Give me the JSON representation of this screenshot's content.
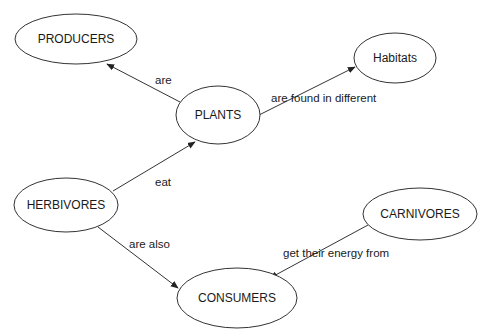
{
  "diagram": {
    "type": "concept-map",
    "nodes": [
      {
        "id": "producers",
        "label": "PRODUCERS",
        "cx": 76,
        "cy": 39,
        "rx": 61,
        "ry": 25
      },
      {
        "id": "plants",
        "label": "PLANTS",
        "cx": 218,
        "cy": 115,
        "rx": 42,
        "ry": 29
      },
      {
        "id": "habitats",
        "label": "Habitats",
        "cx": 395,
        "cy": 58,
        "rx": 41,
        "ry": 25
      },
      {
        "id": "herbivores",
        "label": "HERBIVORES",
        "cx": 66,
        "cy": 205,
        "rx": 52,
        "ry": 27
      },
      {
        "id": "carnivores",
        "label": "CARNIVORES",
        "cx": 420,
        "cy": 214,
        "rx": 57,
        "ry": 26
      },
      {
        "id": "consumers",
        "label": "CONSUMERS",
        "cx": 237,
        "cy": 298,
        "rx": 60,
        "ry": 30
      }
    ],
    "edges": [
      {
        "from": "plants",
        "to": "producers",
        "label": "are",
        "x1": 180,
        "y1": 102,
        "x2": 107,
        "y2": 64,
        "lx": 155,
        "ly": 84
      },
      {
        "from": "plants",
        "to": "habitats",
        "label": "are found in different",
        "x1": 259,
        "y1": 115,
        "x2": 355,
        "y2": 67,
        "lx": 271,
        "ly": 102
      },
      {
        "from": "herbivores",
        "to": "plants",
        "label": "eat",
        "x1": 113,
        "y1": 191,
        "x2": 195,
        "y2": 142,
        "lx": 155,
        "ly": 186
      },
      {
        "from": "herbivores",
        "to": "consumers",
        "label": "are also",
        "x1": 98,
        "y1": 227,
        "x2": 178,
        "y2": 288,
        "lx": 129,
        "ly": 248
      },
      {
        "from": "carnivores",
        "to": "consumers",
        "label": "get their energy from",
        "x1": 368,
        "y1": 225,
        "x2": 270,
        "y2": 278,
        "lx": 283,
        "ly": 257
      }
    ]
  },
  "colors": {
    "background": "#ffffff",
    "stroke": "#333333",
    "text": "#1a1a1a"
  }
}
